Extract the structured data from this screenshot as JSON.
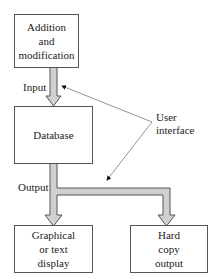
{
  "diagram": {
    "nodes": [
      {
        "id": "addition",
        "lines": [
          "Addition",
          "and",
          "modification"
        ]
      },
      {
        "id": "database",
        "lines": [
          "Database"
        ]
      },
      {
        "id": "graphical",
        "lines": [
          "Graphical",
          "or text",
          "display"
        ]
      },
      {
        "id": "hardcopy",
        "lines": [
          "Hard",
          "copy",
          "output"
        ]
      }
    ],
    "edges": [
      {
        "from": "addition",
        "to": "database",
        "label": "Input"
      },
      {
        "from": "database",
        "to": "graphical",
        "label": "Output"
      },
      {
        "from": "database",
        "to": "hardcopy",
        "label": "Output"
      }
    ],
    "annotation": {
      "lines": [
        "User",
        "interface"
      ],
      "points_to": [
        "Input",
        "Output"
      ]
    },
    "colors": {
      "pipe_fill": "#d0d0d0",
      "stroke": "#555555"
    }
  }
}
